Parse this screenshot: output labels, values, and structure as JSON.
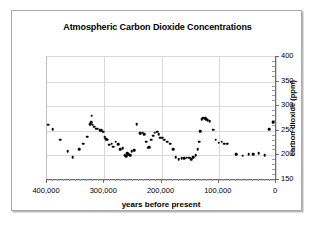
{
  "chart_data": {
    "type": "scatter",
    "title": "Atmospheric Carbon Dioxide Concentrations",
    "xlabel": "years before present",
    "ylabel": "carbon dioxide (ppm)",
    "xlim": [
      400000,
      0
    ],
    "ylim": [
      150,
      400
    ],
    "x_reversed": true,
    "grid": true,
    "legend": "none",
    "xticks": [
      400000,
      300000,
      200000,
      100000,
      0
    ],
    "xtick_labels": [
      "400,000",
      "300,000",
      "200,000",
      "100,000",
      "0"
    ],
    "yticks": [
      150,
      200,
      250,
      300,
      350,
      400
    ],
    "ytick_labels": [
      "150",
      "200",
      "250",
      "300",
      "350",
      "400"
    ],
    "series": [
      {
        "name": "CO2",
        "marker": "filled-circle",
        "color": "#000000",
        "points": [
          [
            398000,
            262
          ],
          [
            390000,
            253
          ],
          [
            377000,
            232
          ],
          [
            364000,
            208
          ],
          [
            355000,
            196
          ],
          [
            344000,
            212
          ],
          [
            337000,
            224
          ],
          [
            330000,
            238
          ],
          [
            325000,
            264
          ],
          [
            323000,
            268
          ],
          [
            322000,
            281
          ],
          [
            320000,
            262
          ],
          [
            318000,
            258
          ],
          [
            315000,
            254
          ],
          [
            312000,
            254
          ],
          [
            308000,
            251
          ],
          [
            305000,
            251
          ],
          [
            302000,
            248
          ],
          [
            299000,
            237
          ],
          [
            297000,
            233
          ],
          [
            294000,
            232
          ],
          [
            291000,
            222
          ],
          [
            287000,
            224
          ],
          [
            284000,
            218
          ],
          [
            280000,
            228
          ],
          [
            276000,
            223
          ],
          [
            272000,
            212
          ],
          [
            268000,
            215
          ],
          [
            264000,
            200
          ],
          [
            262000,
            198
          ],
          [
            260000,
            204
          ],
          [
            258000,
            202
          ],
          [
            255000,
            200
          ],
          [
            252000,
            208
          ],
          [
            248000,
            210
          ],
          [
            243000,
            264
          ],
          [
            238000,
            245
          ],
          [
            236000,
            245
          ],
          [
            233000,
            246
          ],
          [
            230000,
            243
          ],
          [
            227000,
            228
          ],
          [
            224000,
            216
          ],
          [
            221000,
            217
          ],
          [
            218000,
            232
          ],
          [
            215000,
            240
          ],
          [
            212000,
            246
          ],
          [
            208000,
            248
          ],
          [
            205000,
            243
          ],
          [
            202000,
            236
          ],
          [
            199000,
            236
          ],
          [
            195000,
            232
          ],
          [
            190000,
            228
          ],
          [
            185000,
            224
          ],
          [
            180000,
            212
          ],
          [
            175000,
            196
          ],
          [
            170000,
            192
          ],
          [
            165000,
            194
          ],
          [
            160000,
            194
          ],
          [
            156000,
            195
          ],
          [
            152000,
            195
          ],
          [
            148000,
            192
          ],
          [
            145000,
            196
          ],
          [
            140000,
            200
          ],
          [
            137000,
            213
          ],
          [
            134000,
            228
          ],
          [
            132000,
            249
          ],
          [
            130000,
            273
          ],
          [
            128000,
            276
          ],
          [
            126000,
            277
          ],
          [
            124000,
            276
          ],
          [
            122000,
            274
          ],
          [
            119000,
            271
          ],
          [
            116000,
            270
          ],
          [
            110000,
            252
          ],
          [
            105000,
            232
          ],
          [
            100000,
            226
          ],
          [
            95000,
            228
          ],
          [
            90000,
            224
          ],
          [
            85000,
            224
          ],
          [
            70000,
            203
          ],
          [
            58000,
            199
          ],
          [
            48000,
            202
          ],
          [
            40000,
            202
          ],
          [
            30000,
            205
          ],
          [
            20000,
            200
          ],
          [
            12000,
            253
          ],
          [
            5000,
            267
          ]
        ]
      }
    ]
  }
}
